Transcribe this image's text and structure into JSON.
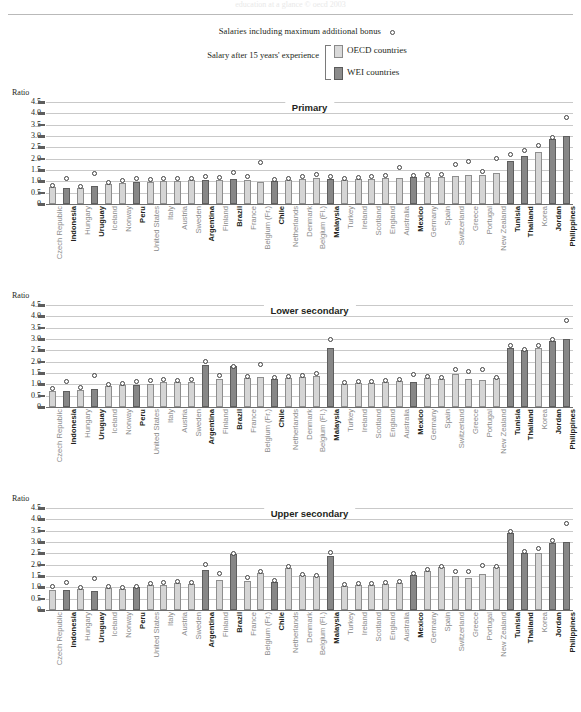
{
  "header": {
    "ghost_line": "education at a glance © oecd 2003"
  },
  "legend": {
    "bonus_label": "Salaries including maximum additional bonus",
    "experience_label": "Salary after 15 years' experience",
    "oecd_label": "OECD countries",
    "wei_label": "WEI countries",
    "colors": {
      "oecd": "#d5d5d5",
      "wei": "#878787",
      "dot": "#ffffff"
    }
  },
  "axis": {
    "ratio_label": "Ratio",
    "ticks": [
      "4.5",
      "4.0",
      "3.5",
      "3.0",
      "2.5",
      "2.0",
      "1.5",
      "1.0",
      "0.5",
      "0"
    ]
  },
  "chart_data": {
    "type": "bar",
    "ylabel": "Ratio",
    "xlabel": "",
    "ylim": [
      0,
      4.5
    ],
    "grid": true,
    "legend_position": "top",
    "categories": [
      "Czech Republic",
      "Indonesia",
      "Hungary",
      "Uruguay",
      "Iceland",
      "Norway",
      "Peru",
      "United States",
      "Italy",
      "Austria",
      "Sweden",
      "Argentina",
      "Finland",
      "Brazil",
      "France",
      "Belgium (Fr.)",
      "Chile",
      "Netherlands",
      "Denmark",
      "Belgium (Fl.)",
      "Malaysia",
      "Turkey",
      "Ireland",
      "Scotland",
      "England",
      "Australia",
      "Mexico",
      "Germany",
      "Spain",
      "Switzerland",
      "Greece",
      "Portugal",
      "New Zealand",
      "Tunisia",
      "Thailand",
      "Korea",
      "Jordan",
      "Philippines"
    ],
    "group": [
      "OECD",
      "WEI",
      "OECD",
      "WEI",
      "OECD",
      "OECD",
      "WEI",
      "OECD",
      "OECD",
      "OECD",
      "OECD",
      "WEI",
      "OECD",
      "WEI",
      "OECD",
      "OECD",
      "WEI",
      "OECD",
      "OECD",
      "OECD",
      "WEI",
      "OECD",
      "OECD",
      "OECD",
      "OECD",
      "OECD",
      "WEI",
      "OECD",
      "OECD",
      "OECD",
      "OECD",
      "OECD",
      "OECD",
      "WEI",
      "WEI",
      "OECD",
      "WEI",
      "WEI"
    ],
    "panels": [
      {
        "name": "Primary",
        "bars": [
          0.75,
          0.72,
          0.7,
          0.78,
          0.88,
          0.94,
          0.98,
          0.98,
          1.0,
          1.02,
          1.04,
          1.06,
          1.08,
          1.1,
          1.08,
          0.95,
          1.02,
          1.05,
          1.1,
          1.16,
          1.12,
          1.06,
          1.1,
          1.12,
          1.14,
          1.15,
          1.17,
          1.2,
          1.18,
          1.25,
          1.28,
          1.3,
          1.38,
          1.9,
          2.1,
          2.3,
          2.85,
          3.0
        ],
        "dots": [
          0.82,
          1.12,
          0.78,
          1.34,
          0.95,
          1.02,
          1.12,
          1.08,
          1.12,
          1.12,
          1.14,
          1.22,
          1.18,
          1.38,
          1.22,
          1.85,
          1.1,
          1.12,
          1.2,
          1.28,
          1.22,
          1.14,
          1.18,
          1.2,
          1.24,
          1.6,
          1.26,
          1.3,
          1.3,
          1.75,
          1.86,
          1.42,
          2.0,
          2.2,
          2.35,
          2.6,
          2.95,
          3.8
        ]
      },
      {
        "name": "Lower secondary",
        "bars": [
          0.72,
          0.7,
          0.74,
          0.8,
          0.92,
          0.98,
          0.98,
          1.02,
          1.1,
          1.12,
          1.12,
          1.85,
          1.22,
          1.8,
          1.28,
          1.32,
          1.22,
          1.28,
          1.32,
          1.38,
          2.6,
          1.02,
          1.06,
          1.08,
          1.1,
          1.16,
          1.12,
          1.28,
          1.24,
          1.45,
          1.22,
          1.18,
          1.26,
          2.62,
          2.5,
          2.6,
          2.9,
          3.0
        ],
        "dots": [
          0.82,
          1.12,
          0.85,
          1.4,
          1.0,
          1.05,
          1.12,
          1.18,
          1.22,
          1.18,
          1.2,
          2.02,
          1.4,
          1.78,
          1.36,
          1.88,
          1.3,
          1.36,
          1.4,
          1.46,
          3.0,
          1.08,
          1.12,
          1.12,
          1.18,
          1.22,
          1.42,
          1.34,
          1.3,
          1.64,
          1.56,
          1.66,
          1.32,
          2.7,
          2.55,
          2.7,
          2.96,
          3.8
        ]
      },
      {
        "name": "Upper secondary",
        "bars": [
          0.88,
          0.9,
          0.92,
          0.86,
          0.95,
          0.92,
          1.0,
          1.1,
          1.12,
          1.18,
          1.14,
          1.78,
          1.32,
          2.45,
          1.28,
          1.62,
          1.25,
          1.85,
          1.55,
          1.5,
          2.4,
          1.05,
          1.12,
          1.12,
          1.14,
          1.18,
          1.55,
          1.7,
          1.88,
          1.5,
          1.42,
          1.58,
          1.88,
          3.4,
          2.52,
          2.52,
          2.95,
          2.98
        ],
        "dots": [
          1.05,
          1.2,
          1.0,
          1.4,
          1.02,
          1.0,
          1.05,
          1.18,
          1.2,
          1.26,
          1.2,
          2.02,
          1.62,
          2.5,
          1.44,
          1.7,
          1.3,
          1.9,
          1.58,
          1.52,
          2.55,
          1.12,
          1.18,
          1.18,
          1.2,
          1.24,
          1.6,
          1.78,
          1.92,
          1.7,
          1.72,
          1.98,
          1.92,
          3.45,
          2.58,
          2.72,
          3.05,
          3.82
        ]
      }
    ]
  }
}
